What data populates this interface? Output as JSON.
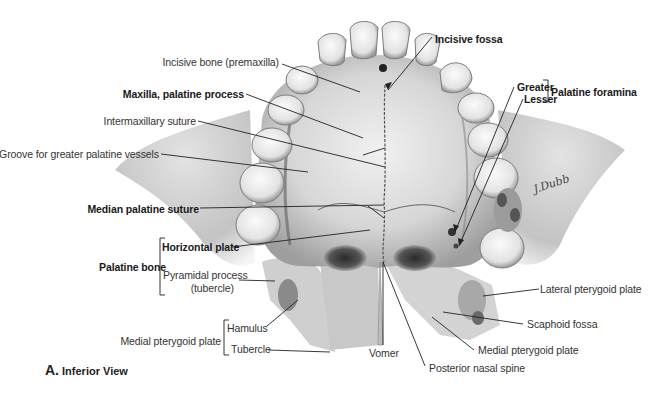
{
  "figure": {
    "caption_letter": "A.",
    "caption_text": "Inferior View",
    "signature": "J.Dubb"
  },
  "labels": {
    "incisive_bone": "Incisive bone (premaxilla)",
    "maxilla_palatine_process": "Maxilla, palatine process",
    "intermaxillary_suture": "Intermaxillary suture",
    "groove_greater_palatine": "Groove for greater palatine vessels",
    "median_palatine_suture": "Median palatine suture",
    "palatine_bone": "Palatine bone",
    "horizontal_plate": "Horizontal plate",
    "pyramidal_process_1": "Pyramidal process",
    "pyramidal_process_2": "(tubercle)",
    "medial_pterygoid_plate_left": "Medial pterygoid plate",
    "hamulus": "Hamulus",
    "tubercle": "Tubercle",
    "vomer": "Vomer",
    "posterior_nasal_spine": "Posterior nasal spine",
    "medial_pterygoid_plate_right": "Medial pterygoid plate",
    "scaphoid_fossa": "Scaphoid fossa",
    "lateral_pterygoid_plate": "Lateral pterygoid plate",
    "incisive_fossa": "Incisive fossa",
    "greater": "Greater",
    "lesser": "Lesser",
    "palatine_foramina": "Palatine foramina"
  },
  "colors": {
    "bone_light": "#e6e6e6",
    "bone_mid": "#c4c4c4",
    "bone_dark": "#7a7a7a",
    "leader": "#222222",
    "text": "#333333"
  }
}
